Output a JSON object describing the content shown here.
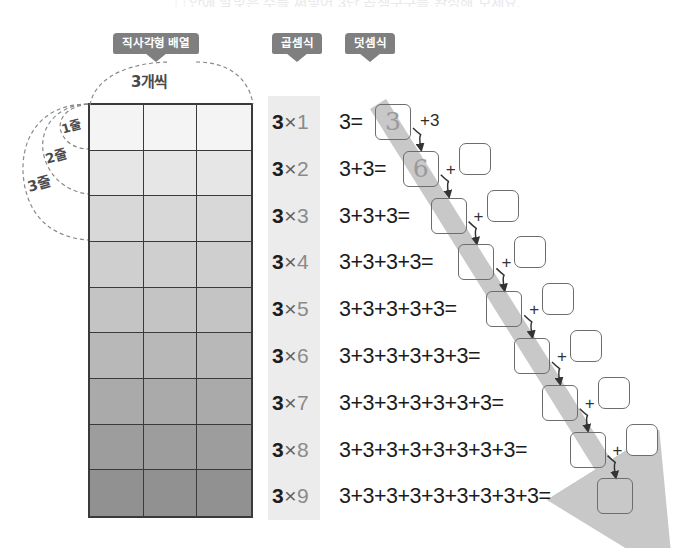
{
  "page": {
    "top_clipped_text": "□ 안에 알맞은 수를 써넣어 3단 곱셈구구를 완성해 보세요.",
    "background_color": "#ffffff"
  },
  "badges": {
    "array": "직사각형 배열",
    "multiplication": "곱셈식",
    "addition": "덧셈식",
    "color": "#7f7f7f",
    "text_color": "#ffffff"
  },
  "annotations": {
    "columns_label": "3개씩",
    "row_labels": [
      "1줄",
      "2줄",
      "3줄"
    ],
    "label_color": "#4a4a4a"
  },
  "grid": {
    "columns": 3,
    "rows": 9,
    "border_color": "#3a3a3a",
    "row_fills": [
      "#f4f4f4",
      "#e6e6e6",
      "#d8d8d8",
      "#cfcfcf",
      "#c4c4c4",
      "#b8b8b8",
      "#aaaaaa",
      "#9d9d9d",
      "#919191"
    ]
  },
  "multiplication": {
    "panel_color": "#ececec",
    "multiplicand": "3",
    "operator": "×",
    "rows": [
      {
        "left": "3",
        "op": "×",
        "right": "1"
      },
      {
        "left": "3",
        "op": "×",
        "right": "2"
      },
      {
        "left": "3",
        "op": "×",
        "right": "3"
      },
      {
        "left": "3",
        "op": "×",
        "right": "4"
      },
      {
        "left": "3",
        "op": "×",
        "right": "5"
      },
      {
        "left": "3",
        "op": "×",
        "right": "6"
      },
      {
        "left": "3",
        "op": "×",
        "right": "7"
      },
      {
        "left": "3",
        "op": "×",
        "right": "8"
      },
      {
        "left": "3",
        "op": "×",
        "right": "9"
      }
    ]
  },
  "addition": {
    "rows": [
      {
        "expression": "3=",
        "answer": "3",
        "step_label": "+3",
        "has_plus_box": false
      },
      {
        "expression": "3+3=",
        "answer": "6",
        "step_label": "+",
        "has_plus_box": true
      },
      {
        "expression": "3+3+3=",
        "answer": "",
        "step_label": "+",
        "has_plus_box": true
      },
      {
        "expression": "3+3+3+3=",
        "answer": "",
        "step_label": "+",
        "has_plus_box": true
      },
      {
        "expression": "3+3+3+3+3=",
        "answer": "",
        "step_label": "+",
        "has_plus_box": true
      },
      {
        "expression": "3+3+3+3+3+3=",
        "answer": "",
        "step_label": "+",
        "has_plus_box": true
      },
      {
        "expression": "3+3+3+3+3+3+3=",
        "answer": "",
        "step_label": "+",
        "has_plus_box": true
      },
      {
        "expression": "3+3+3+3+3+3+3+3=",
        "answer": "",
        "step_label": "+",
        "has_plus_box": true
      },
      {
        "expression": "3+3+3+3+3+3+3+3+3=",
        "answer": "",
        "step_label": "",
        "has_plus_box": false
      }
    ],
    "diagonal_band_color": "#c8c8c8",
    "box_border_color": "#6d6d6d",
    "answer_text_color": "#9a9a9a"
  }
}
